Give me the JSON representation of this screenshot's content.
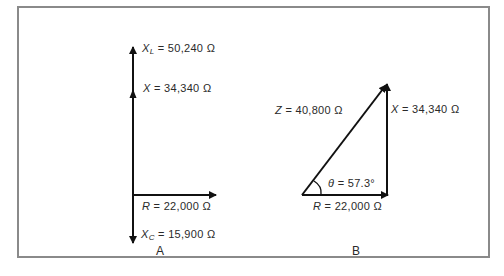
{
  "figure": {
    "panel_a": {
      "caption": "A",
      "labels": {
        "xl_symbol": "X",
        "xl_sub": "L",
        "xl_value": "= 50,240 Ω",
        "x_symbol": "X",
        "x_value": "= 34,340 Ω",
        "r_symbol": "R",
        "r_value": "= 22,000 Ω",
        "xc_symbol": "X",
        "xc_sub": "C",
        "xc_value": "= 15,900 Ω"
      }
    },
    "panel_b": {
      "caption": "B",
      "labels": {
        "z_symbol": "Z",
        "z_value": "= 40,800 Ω",
        "x_symbol": "X",
        "x_value": "= 34,340 Ω",
        "theta_symbol": "θ",
        "theta_value": "= 57.3°",
        "r_symbol": "R",
        "r_value": "= 22,000 Ω"
      }
    },
    "colors": {
      "line": "#111111",
      "border": "#8a8a8a",
      "text": "#2a2a2a"
    }
  }
}
